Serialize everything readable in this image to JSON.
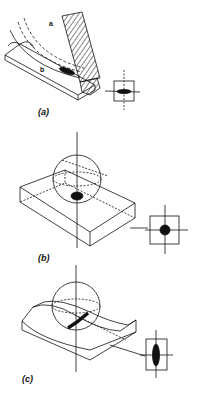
{
  "figure": {
    "panels": [
      {
        "id": "a",
        "label": "(a)",
        "description": "Grinding wheel on ridged track with elliptical contact area; inset shows horizontal ellipse contact patch",
        "annotations": [
          "a",
          "b"
        ],
        "contact_shape": "horizontal-ellipse"
      },
      {
        "id": "b",
        "label": "(b)",
        "description": "Sphere on flat block; inset shows circular contact patch",
        "contact_shape": "circle"
      },
      {
        "id": "c",
        "label": "(c)",
        "description": "Sphere in concave groove; inset shows vertical elongated ellipse contact patch",
        "contact_shape": "vertical-ellipse"
      }
    ],
    "colors": {
      "ink": "#111111",
      "paper": "#ffffff"
    }
  }
}
